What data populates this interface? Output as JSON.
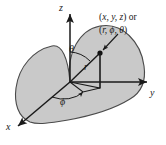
{
  "figure": {
    "type": "3d-coordinate-diagram",
    "background_color": "#ffffff",
    "shaded_region": {
      "name": "half-plane-sector",
      "fill_color": "#c9c9c9",
      "stroke_color": "#4a4a4a"
    },
    "line_color": "#1a1a1a",
    "axes": [
      {
        "id": "z",
        "label": "z",
        "label_x": 59,
        "label_y": 4
      },
      {
        "id": "y",
        "label": "y",
        "label_x": 150,
        "label_y": 94
      },
      {
        "id": "x",
        "label": "x",
        "label_x": 6,
        "label_y": 125
      }
    ],
    "angles": [
      {
        "id": "theta",
        "label": "θ",
        "label_x": 70,
        "label_y": 45
      },
      {
        "id": "phi",
        "label": "ϕ",
        "label_x": 60,
        "label_y": 97
      }
    ],
    "radial": {
      "id": "r",
      "label": "r",
      "label_x": 84,
      "label_y": 63
    },
    "point_label": {
      "line1_paren_open": "(",
      "line1_vars": "x, y, z",
      "line1_suffix": ") or",
      "line2_paren_open": "(",
      "line2_vars": "r, ϕ, θ",
      "line2_suffix": ")",
      "full_text_line1": "(x, y, z) or",
      "full_text_line2": "(r, ϕ, θ)"
    },
    "point": {
      "id": "P",
      "x": 100,
      "y": 53
    },
    "origin": {
      "x": 70,
      "y": 82
    }
  }
}
